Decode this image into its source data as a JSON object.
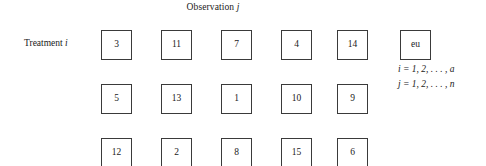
{
  "figure": {
    "column_axis_label": {
      "text": "Observation",
      "symbol": "j"
    },
    "row_axis_label": {
      "text": "Treatment",
      "symbol": "i"
    },
    "grid": {
      "rows": 3,
      "columns": 6,
      "cells": [
        [
          "3",
          "11",
          "7",
          "4",
          "14",
          "eu"
        ],
        [
          "5",
          "13",
          "1",
          "10",
          "9",
          ""
        ],
        [
          "12",
          "2",
          "8",
          "15",
          "6",
          ""
        ]
      ]
    },
    "index_notation": [
      "i = 1, 2, . . . , a",
      "j = 1, 2, . . . , n"
    ],
    "colors": {
      "background": "#ffffff",
      "box_border": "#3a3a3a",
      "text": "#1a1a1a"
    }
  }
}
